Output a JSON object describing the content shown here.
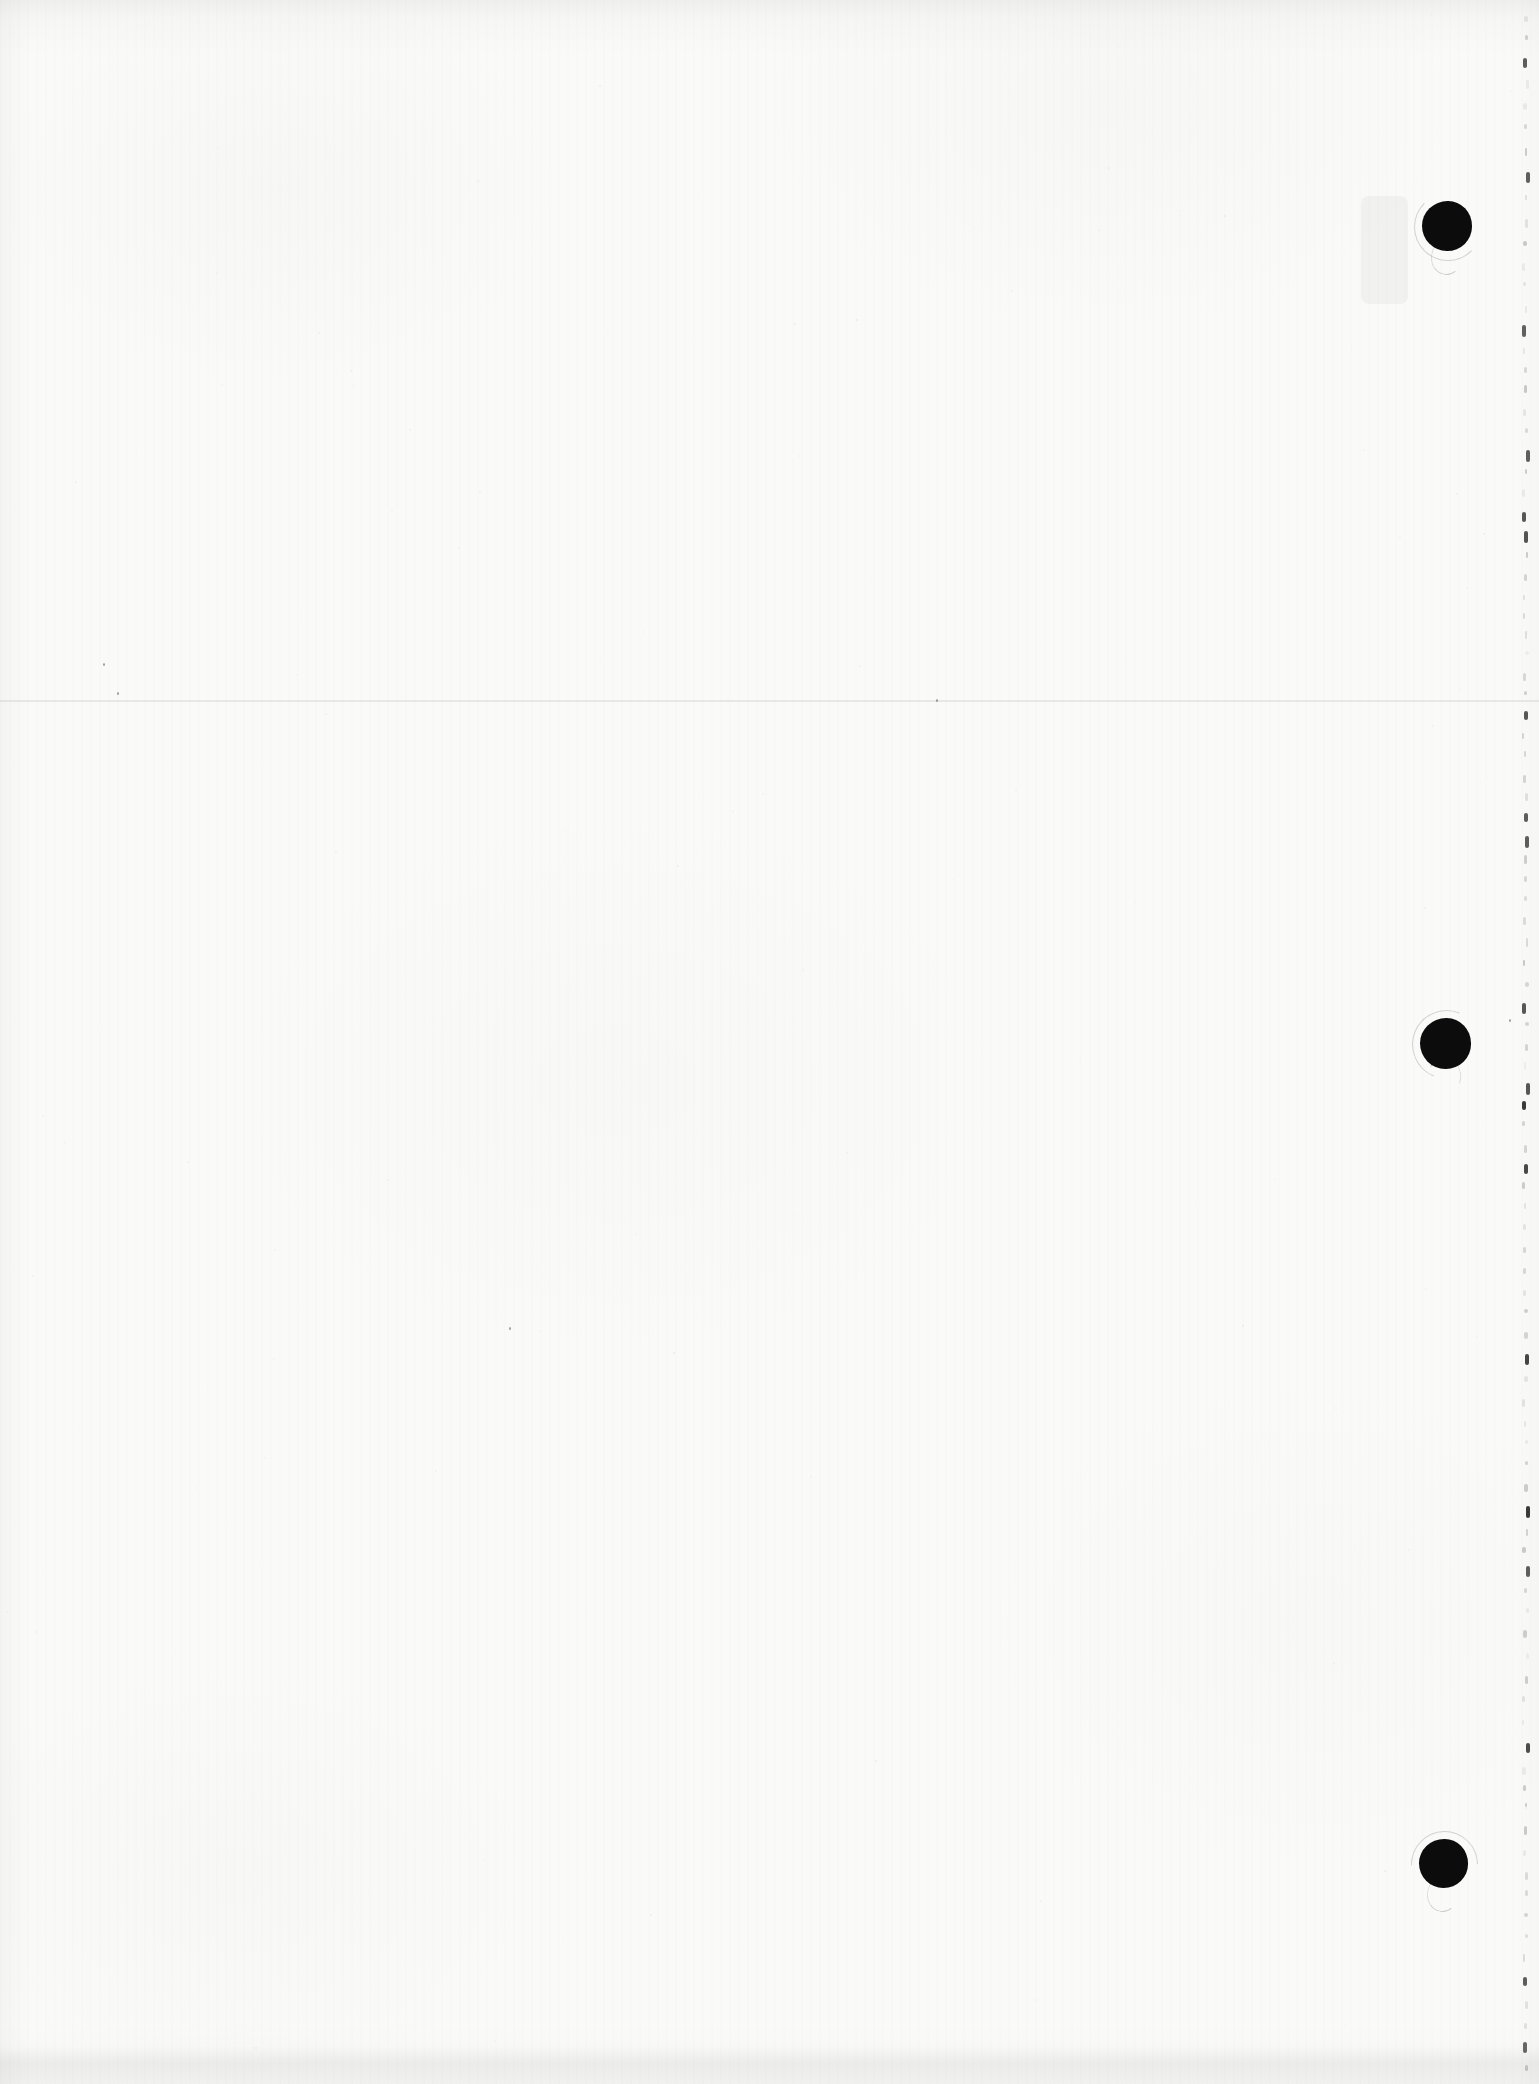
{
  "document": {
    "kind": "blank scanned page",
    "paper_color": "#fafaf9",
    "width_px": 1539,
    "height_px": 2084
  },
  "artifacts": {
    "hole_punch_dots": [
      {
        "cx": 1447,
        "cy": 226,
        "diameter": 50,
        "color": "#0c0c0c"
      },
      {
        "cx": 1445,
        "cy": 1043,
        "diameter": 51,
        "color": "#0c0c0c"
      },
      {
        "cx": 1443,
        "cy": 1863,
        "diameter": 49,
        "color": "#0c0c0c"
      }
    ],
    "crease_line": {
      "y": 700,
      "height": 2,
      "color": "rgba(75,75,68,0.10)"
    },
    "right_edge_marks": {
      "x": 1524,
      "top": 16,
      "bottom": 2080,
      "spacing": 21,
      "color": "#2e2e2c",
      "prominent_y": [
        62,
        173,
        322,
        440,
        523,
        705,
        820,
        838,
        1007,
        1090,
        1170,
        1353,
        1517,
        1572,
        1745,
        1968,
        2040
      ]
    },
    "smudge": {
      "x": 1361,
      "y": 196,
      "width": 47,
      "height": 108,
      "color": "rgba(70,70,62,0.05)"
    },
    "specks": [
      {
        "x": 103,
        "y": 663
      },
      {
        "x": 117,
        "y": 692
      },
      {
        "x": 936,
        "y": 699
      },
      {
        "x": 509,
        "y": 1327
      },
      {
        "x": 1509,
        "y": 1019
      }
    ],
    "bottom_shadow": {
      "from_y": 2046,
      "height": 38,
      "color": "rgba(55,55,48,0.06)"
    },
    "noise": {
      "count": 170,
      "color": "#55554f"
    }
  }
}
